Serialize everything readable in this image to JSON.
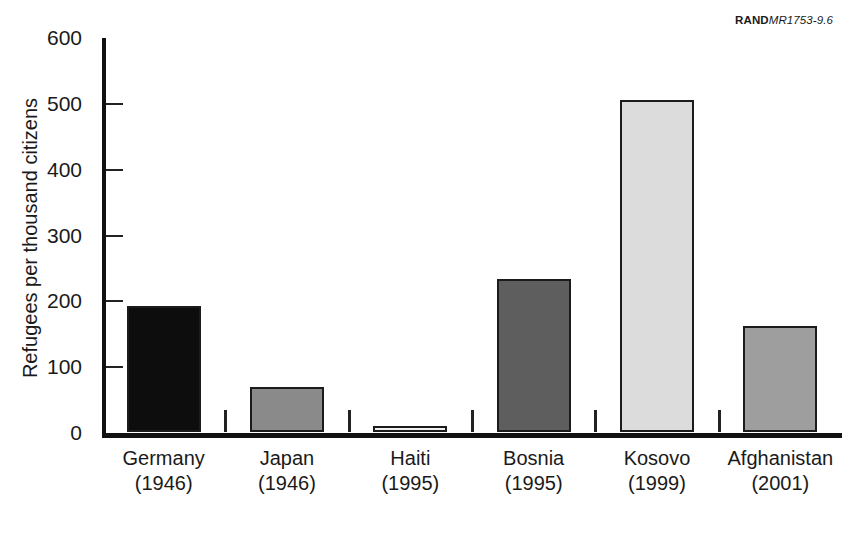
{
  "figure_id": {
    "brand": "RAND",
    "number": "MR1753-9.6"
  },
  "caption_partial": "",
  "chart_data": {
    "type": "bar",
    "title": "",
    "xlabel": "",
    "ylabel": "Refugees per thousand citizens",
    "ylim": [
      0,
      600
    ],
    "ytick_labels": [
      "600",
      "500",
      "400",
      "300",
      "200",
      "100",
      "0"
    ],
    "yticks": [
      600,
      500,
      400,
      300,
      200,
      100,
      0
    ],
    "grid": false,
    "legend": "none",
    "categories": [
      "Germany",
      "Japan",
      "Haiti",
      "Bosnia",
      "Kosovo",
      "Afghanistan"
    ],
    "category_years": [
      "(1946)",
      "(1946)",
      "(1995)",
      "(1995)",
      "(1999)",
      "(2001)"
    ],
    "values": [
      192,
      69,
      9,
      233,
      505,
      161
    ],
    "bar_colors": [
      "#0d0d0d",
      "#8a8a8a",
      "#f0f0f0",
      "#5e5e5e",
      "#dcdcdc",
      "#9e9e9e"
    ]
  }
}
